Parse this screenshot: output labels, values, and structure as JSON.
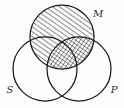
{
  "figure": {
    "name": "three-circle-venn-syllogism-diagram",
    "type": "venn-diagram",
    "background_color": "#fdfdfd",
    "stroke_color": "#1a1a1a",
    "hatch_color": "#1a1a1a",
    "width": 124,
    "height": 108
  },
  "circles": [
    {
      "id": "M",
      "label": "M",
      "label_position": "top-right",
      "position": "top-center",
      "cx": 62,
      "cy": 37,
      "r": 32,
      "shaded": true,
      "shading": "diagonal-hatch"
    },
    {
      "id": "S",
      "label": "S",
      "label_position": "bottom-left",
      "position": "bottom-left",
      "cx": 45,
      "cy": 69,
      "r": 32,
      "shaded": false,
      "shading": "none"
    },
    {
      "id": "P",
      "label": "P",
      "label_position": "bottom-right",
      "position": "bottom-right",
      "cx": 79,
      "cy": 69,
      "r": 32,
      "shaded": false,
      "shading": "none"
    }
  ],
  "regions": [
    {
      "id": "M-only",
      "description": "M alone",
      "shading": "diagonal-hatch"
    },
    {
      "id": "M-and-S",
      "description": "M intersect S",
      "shading": "diagonal-hatch"
    },
    {
      "id": "M-and-P",
      "description": "M intersect P",
      "shading": "cross-hatch"
    },
    {
      "id": "M-and-S-and-P",
      "description": "M intersect S intersect P",
      "shading": "cross-hatch"
    },
    {
      "id": "S-only",
      "description": "S alone",
      "shading": "none"
    },
    {
      "id": "P-only",
      "description": "P alone",
      "shading": "none"
    },
    {
      "id": "S-and-P",
      "description": "S intersect P outside M",
      "shading": "none"
    }
  ],
  "labels": {
    "m": "M",
    "s": "S",
    "p": "P"
  }
}
